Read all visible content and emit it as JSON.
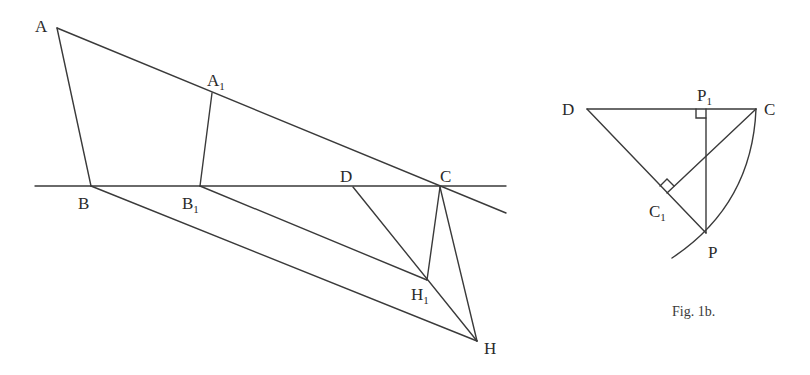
{
  "figure_a": {
    "labels": {
      "A": "A",
      "A1_main": "A",
      "A1_sub": "1",
      "B": "B",
      "B1_main": "B",
      "B1_sub": "1",
      "D": "D",
      "C": "C",
      "H1_main": "H",
      "H1_sub": "1",
      "H": "H"
    }
  },
  "figure_b": {
    "labels": {
      "D": "D",
      "C": "C",
      "P1_main": "P",
      "P1_sub": "1",
      "C1_main": "C",
      "C1_sub": "1",
      "P": "P"
    },
    "caption": "Fig. 1b."
  }
}
